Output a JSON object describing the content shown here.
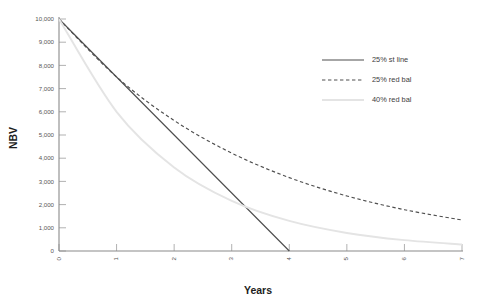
{
  "chart_data": {
    "type": "line",
    "title": "",
    "xlabel": "Years",
    "ylabel": "NBV",
    "x": [
      0,
      1,
      2,
      3,
      4,
      5,
      6,
      7
    ],
    "xtick_labels": [
      "0",
      "1",
      "2",
      "3",
      "4",
      "5",
      "6",
      "7"
    ],
    "ytick_labels": [
      "0",
      "1,000",
      "2,000",
      "3,000",
      "4,000",
      "5,000",
      "6,000",
      "7,000",
      "8,000",
      "9,000",
      "10,000"
    ],
    "ytick_values": [
      0,
      1000,
      2000,
      3000,
      4000,
      5000,
      6000,
      7000,
      8000,
      9000,
      10000
    ],
    "xlim": [
      0,
      7
    ],
    "ylim": [
      0,
      10000
    ],
    "grid": false,
    "legend_position": "upper right",
    "series": [
      {
        "name": "25% st line",
        "style": "solid",
        "color": "#4f4f4f",
        "values": [
          10000,
          7500,
          5000,
          2500,
          0,
          null,
          null,
          null
        ]
      },
      {
        "name": "25% red bal",
        "style": "dashed",
        "color": "#4f4f4f",
        "values": [
          10000,
          7500,
          5625,
          4219,
          3164,
          2373,
          1780,
          1335
        ]
      },
      {
        "name": "40% red bal",
        "style": "solid",
        "color": "#e4e4e4",
        "values": [
          10000,
          6000,
          3600,
          2160,
          1296,
          778,
          467,
          280
        ]
      }
    ]
  },
  "axes": {
    "y_title": "NBV",
    "x_title": "Years"
  },
  "legend": {
    "items": [
      {
        "label": "25% st line",
        "swatch": "solid-line-swatch"
      },
      {
        "label": "25% red bal",
        "swatch": "dashed-line-swatch"
      },
      {
        "label": "40% red bal",
        "swatch": "light-line-swatch"
      }
    ]
  },
  "colors": {
    "axis": "#8a8a8a",
    "solid_series": "#4f4f4f",
    "dashed_series": "#4f4f4f",
    "light_series": "#e4e4e4",
    "text": "#3a3a3a",
    "background": "#ffffff"
  }
}
